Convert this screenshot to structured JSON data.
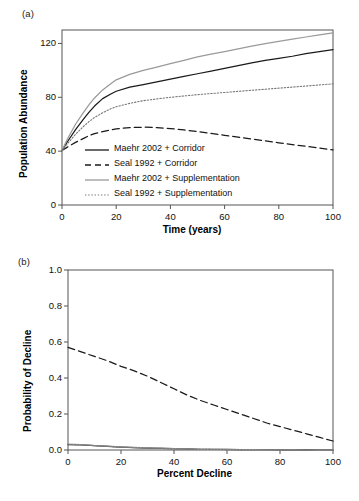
{
  "figure": {
    "panels": [
      {
        "key": "a",
        "label": "(a)",
        "xlabel": "Time (years)",
        "ylabel": "Population Abundance"
      },
      {
        "key": "b",
        "label": "(b)",
        "xlabel": "Percent Decline",
        "ylabel": "Probability of Decline"
      }
    ]
  },
  "series_names": {
    "maehr_corridor": "Maehr 2002 + Corridor",
    "seal_corridor": "Seal 1992 + Corridor",
    "maehr_supp": "Maehr 2002 + Supplementation",
    "seal_supp": "Seal 1992 + Supplementation"
  },
  "colors": {
    "black": "#1a1a1a",
    "gray": "#9a9a9a",
    "axis": "#555555",
    "background": "#ffffff"
  },
  "chart_data": [
    {
      "type": "line",
      "panel": "a",
      "title": "(a)",
      "xlabel": "Time (years)",
      "ylabel": "Population Abundance",
      "xlim": [
        0,
        100
      ],
      "ylim": [
        0,
        130
      ],
      "xticks": [
        0,
        20,
        40,
        60,
        80,
        100
      ],
      "yticks": [
        0,
        40,
        80,
        120
      ],
      "ytick_labels": [
        "0",
        "40",
        "80",
        "120"
      ],
      "xtick_labels": [
        "0",
        "20",
        "40",
        "60",
        "80",
        "100"
      ],
      "grid": false,
      "legend_position": "inside-lower-left",
      "x": [
        0,
        2,
        5,
        8,
        10,
        12,
        15,
        18,
        20,
        25,
        30,
        35,
        40,
        45,
        50,
        55,
        60,
        65,
        70,
        75,
        80,
        85,
        90,
        95,
        100
      ],
      "series": [
        {
          "name": "Maehr 2002 + Corridor",
          "style": "solid",
          "color": "#1a1a1a",
          "values": [
            40.5,
            47,
            56,
            64,
            69,
            73.5,
            79,
            82.5,
            84.5,
            87.5,
            89.5,
            91.5,
            93.5,
            95.5,
            97.5,
            99.5,
            101.5,
            103.5,
            105.5,
            107.5,
            109,
            110.5,
            112.5,
            114,
            115.5
          ]
        },
        {
          "name": "Seal 1992 + Corridor",
          "style": "dashed",
          "color": "#1a1a1a",
          "values": [
            40.5,
            43,
            46.5,
            49.5,
            51.5,
            53,
            54.5,
            55.8,
            56.5,
            57.5,
            57.8,
            57.5,
            56.8,
            55.8,
            54.5,
            53.2,
            51.8,
            50.4,
            49,
            47.6,
            46.2,
            44.9,
            43.6,
            42.3,
            41
          ]
        },
        {
          "name": "Maehr 2002 + Supplementation",
          "style": "solid",
          "color": "#9a9a9a",
          "values": [
            40.5,
            49,
            60,
            69,
            74.5,
            79.5,
            85.5,
            90,
            93,
            97,
            100,
            102.5,
            105,
            107.5,
            110,
            112,
            114,
            116,
            118,
            119.8,
            121.5,
            123.2,
            124.8,
            126.3,
            127.8
          ]
        },
        {
          "name": "Seal 1992 + Supplementation",
          "style": "dotted",
          "color": "#777777",
          "values": [
            40.5,
            45.5,
            52.5,
            58.5,
            62,
            65,
            68.5,
            71.5,
            73,
            75.5,
            77.5,
            78.8,
            80,
            81,
            82,
            82.8,
            83.6,
            84.4,
            85.2,
            86,
            86.8,
            87.6,
            88.4,
            89.2,
            90
          ]
        }
      ]
    },
    {
      "type": "line",
      "panel": "b",
      "title": "(b)",
      "xlabel": "Percent Decline",
      "ylabel": "Probability of Decline",
      "xlim": [
        0,
        100
      ],
      "ylim": [
        0,
        1.0
      ],
      "xticks": [
        0,
        20,
        40,
        60,
        80,
        100
      ],
      "yticks": [
        0.0,
        0.2,
        0.4,
        0.6,
        0.8,
        1.0
      ],
      "ytick_labels": [
        "0.0",
        "0.2",
        "0.4",
        "0.6",
        "0.8",
        "1.0"
      ],
      "xtick_labels": [
        "0",
        "20",
        "40",
        "60",
        "80",
        "100"
      ],
      "grid": false,
      "legend_position": "inside-upper-right",
      "x": [
        0,
        5,
        10,
        15,
        20,
        25,
        30,
        35,
        40,
        45,
        50,
        55,
        60,
        65,
        70,
        75,
        80,
        85,
        90,
        95,
        100
      ],
      "series": [
        {
          "name": "Maehr 2002 + Corridor",
          "style": "solid",
          "color": "#1a1a1a",
          "values": [
            0.03,
            0.028,
            0.024,
            0.02,
            0.016,
            0.013,
            0.011,
            0.009,
            0.008,
            0.006,
            0.004,
            0.003,
            0.003,
            0.002,
            0.002,
            0.002,
            0.001,
            0.001,
            0.001,
            0.0,
            0.0
          ]
        },
        {
          "name": "Seal 1992 + Corridor",
          "style": "dashed",
          "color": "#1a1a1a",
          "values": [
            0.57,
            0.545,
            0.52,
            0.495,
            0.465,
            0.44,
            0.41,
            0.375,
            0.34,
            0.305,
            0.275,
            0.25,
            0.225,
            0.2,
            0.175,
            0.15,
            0.13,
            0.11,
            0.09,
            0.07,
            0.05
          ]
        },
        {
          "name": "Maehr 2002 + Supplementation",
          "style": "solid",
          "color": "#9a9a9a",
          "values": [
            0.032,
            0.03,
            0.025,
            0.021,
            0.017,
            0.014,
            0.012,
            0.01,
            0.008,
            0.006,
            0.004,
            0.003,
            0.002,
            0.002,
            0.002,
            0.001,
            0.001,
            0.001,
            0.0,
            0.0,
            0.0
          ]
        },
        {
          "name": "Seal 1992 + Supplementation",
          "style": "dotted",
          "color": "#777777",
          "values": [
            0.031,
            0.029,
            0.024,
            0.02,
            0.016,
            0.013,
            0.011,
            0.009,
            0.007,
            0.005,
            0.004,
            0.003,
            0.002,
            0.002,
            0.001,
            0.001,
            0.001,
            0.0,
            0.0,
            0.0,
            0.0
          ]
        }
      ]
    }
  ]
}
